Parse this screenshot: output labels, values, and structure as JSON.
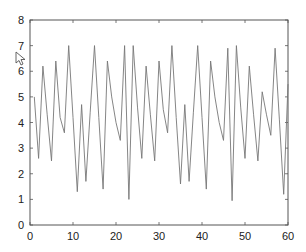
{
  "chart_data": {
    "type": "line",
    "title": "",
    "xlabel": "",
    "ylabel": "",
    "xlim": [
      0,
      60
    ],
    "ylim": [
      0,
      8
    ],
    "grid": false,
    "legend": null,
    "x_ticks": [
      0,
      10,
      20,
      30,
      40,
      50,
      60
    ],
    "y_ticks": [
      0,
      1,
      2,
      3,
      4,
      5,
      6,
      7,
      8
    ],
    "line_color": "#777777",
    "series": [
      {
        "name": "signal",
        "x": [
          1,
          2,
          3,
          4,
          5,
          6,
          7,
          8,
          9,
          10,
          11,
          12,
          13,
          14,
          15,
          16,
          17,
          18,
          19,
          20,
          21,
          22,
          23,
          24,
          25,
          26,
          27,
          28,
          29,
          30,
          31,
          32,
          33,
          34,
          35,
          36,
          37,
          38,
          39,
          40,
          41,
          42,
          43,
          44,
          45,
          46,
          47,
          48,
          49,
          50,
          51,
          52,
          53,
          54,
          55,
          56,
          57,
          58,
          59,
          60
        ],
        "values": [
          5.0,
          2.6,
          6.2,
          4.3,
          2.5,
          6.4,
          4.2,
          3.6,
          7.0,
          4.2,
          1.3,
          4.7,
          1.7,
          4.4,
          7.0,
          4.2,
          1.4,
          6.4,
          5.0,
          4.0,
          3.3,
          7.0,
          1.0,
          7.0,
          4.6,
          2.6,
          6.2,
          4.3,
          2.5,
          6.4,
          4.5,
          3.6,
          7.0,
          4.2,
          1.6,
          4.7,
          1.7,
          4.4,
          7.0,
          4.2,
          1.4,
          6.4,
          5.0,
          4.0,
          3.3,
          6.9,
          0.95,
          7.0,
          4.6,
          2.6,
          6.2,
          4.3,
          2.5,
          5.2,
          4.3,
          3.5,
          6.9,
          4.1,
          1.2,
          5.5
        ]
      }
    ]
  },
  "axes": {
    "x_tick_labels": [
      "0",
      "10",
      "20",
      "30",
      "40",
      "50",
      "60"
    ],
    "y_tick_labels": [
      "0",
      "1",
      "2",
      "3",
      "4",
      "5",
      "6",
      "7",
      "8"
    ]
  },
  "overlay": {
    "cursor_icon": "mouse-pointer-arrow"
  }
}
